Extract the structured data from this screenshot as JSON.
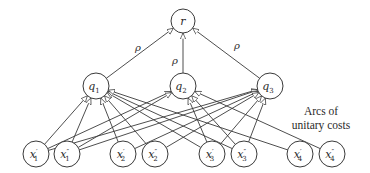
{
  "diagram": {
    "root": {
      "id": "r",
      "label": "r",
      "x": 183,
      "y": 21
    },
    "middle": [
      {
        "id": "q1",
        "base": "q",
        "sub": "1",
        "x": 96,
        "y": 86
      },
      {
        "id": "q2",
        "base": "q",
        "sub": "2",
        "x": 183,
        "y": 86
      },
      {
        "id": "q3",
        "base": "q",
        "sub": "3",
        "x": 270,
        "y": 86
      }
    ],
    "leaves": [
      {
        "id": "x1p",
        "base": "x",
        "prime": "′",
        "sub": "1",
        "x": 36,
        "y": 154
      },
      {
        "id": "x1pp",
        "base": "x",
        "prime": "″",
        "sub": "1",
        "x": 67,
        "y": 154
      },
      {
        "id": "x2p",
        "base": "x",
        "prime": "′",
        "sub": "2",
        "x": 123,
        "y": 154
      },
      {
        "id": "x2pp",
        "base": "x",
        "prime": "″",
        "sub": "2",
        "x": 155,
        "y": 154
      },
      {
        "id": "x3p",
        "base": "x",
        "prime": "′",
        "sub": "3",
        "x": 212,
        "y": 154
      },
      {
        "id": "x3pp",
        "base": "x",
        "prime": "″",
        "sub": "3",
        "x": 244,
        "y": 154
      },
      {
        "id": "x4p",
        "base": "x",
        "prime": "′",
        "sub": "4",
        "x": 300,
        "y": 154
      },
      {
        "id": "x4pp",
        "base": "x",
        "prime": "″",
        "sub": "4",
        "x": 332,
        "y": 154
      }
    ],
    "top_edges": [
      {
        "from": "q1",
        "to": "r",
        "label": "ρ"
      },
      {
        "from": "q2",
        "to": "r",
        "label": "ρ"
      },
      {
        "from": "q3",
        "to": "r",
        "label": "ρ"
      }
    ],
    "bottom_edges": [
      {
        "from": "x1p",
        "to": "q1"
      },
      {
        "from": "x1p",
        "to": "q2"
      },
      {
        "from": "x1p",
        "to": "q3"
      },
      {
        "from": "x1pp",
        "to": "q1"
      },
      {
        "from": "x1pp",
        "to": "q2"
      },
      {
        "from": "x1pp",
        "to": "q3"
      },
      {
        "from": "x2p",
        "to": "q1"
      },
      {
        "from": "x2p",
        "to": "q3"
      },
      {
        "from": "x2pp",
        "to": "q1"
      },
      {
        "from": "x2pp",
        "to": "q3"
      },
      {
        "from": "x3p",
        "to": "q1"
      },
      {
        "from": "x3p",
        "to": "q2"
      },
      {
        "from": "x3p",
        "to": "q3"
      },
      {
        "from": "x3pp",
        "to": "q1"
      },
      {
        "from": "x3pp",
        "to": "q2"
      },
      {
        "from": "x3pp",
        "to": "q3"
      },
      {
        "from": "x4p",
        "to": "q1"
      },
      {
        "from": "x4pp",
        "to": "q2"
      }
    ],
    "annotation": {
      "line1": "Arcs of",
      "line2": "unitary costs"
    },
    "rho_labels": {
      "left": "ρ",
      "middle": "ρ",
      "right": "ρ"
    }
  }
}
